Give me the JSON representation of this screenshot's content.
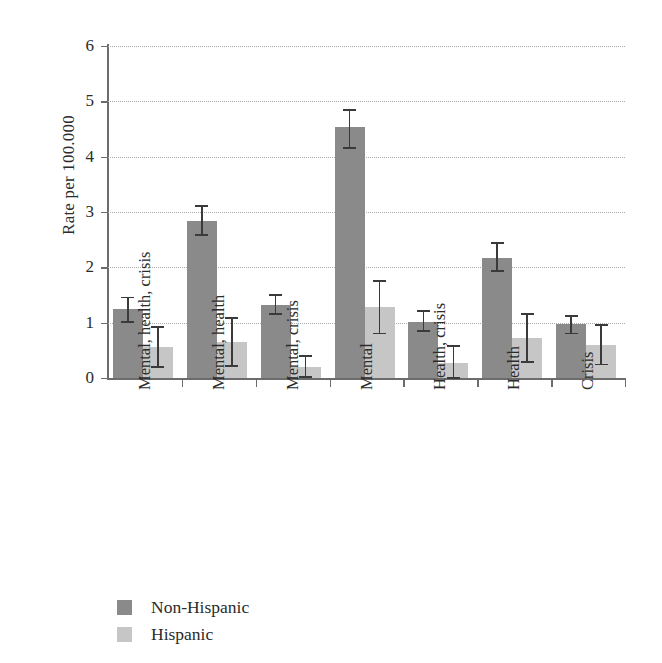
{
  "chart_data": {
    "type": "bar",
    "title": "",
    "subtitle": "",
    "xlabel": "",
    "ylabel": "Rate per 100.000",
    "ylim": [
      0,
      6
    ],
    "yticks": [
      0,
      1,
      2,
      3,
      4,
      5,
      6
    ],
    "ytick_labels": [
      "0",
      "1",
      "2",
      "3",
      "4",
      "5",
      "6"
    ],
    "grid": "horizontal-dotted",
    "legend_position": "bottom-left",
    "categories": [
      "Mental, health, crisis",
      "Mental, health",
      "Mental, crisis",
      "Mental",
      "Health, crisis",
      "Health",
      "Crisis"
    ],
    "series": [
      {
        "name": "Non-Hispanic",
        "color": "#8a8a8a",
        "values": [
          1.25,
          2.83,
          1.32,
          4.53,
          1.02,
          2.17,
          0.97
        ],
        "err_low": [
          1.03,
          2.6,
          1.17,
          4.17,
          0.86,
          1.95,
          0.82
        ],
        "err_high": [
          1.47,
          3.12,
          1.52,
          4.86,
          1.22,
          2.45,
          1.14
        ]
      },
      {
        "name": "Hispanic",
        "color": "#c6c6c6",
        "values": [
          0.56,
          0.65,
          0.2,
          1.28,
          0.28,
          0.72,
          0.6
        ],
        "err_low": [
          0.21,
          0.23,
          0.03,
          0.82,
          0.02,
          0.3,
          0.26
        ],
        "err_high": [
          0.94,
          1.1,
          0.42,
          1.77,
          0.6,
          1.18,
          0.97
        ]
      }
    ]
  },
  "legend": {
    "items": [
      {
        "label": "Non-Hispanic",
        "color": "#8a8a8a"
      },
      {
        "label": "Hispanic",
        "color": "#c6c6c6"
      }
    ]
  }
}
